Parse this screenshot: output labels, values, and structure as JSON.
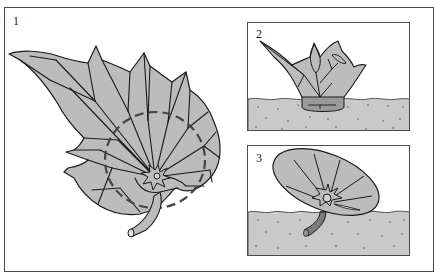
{
  "figure": {
    "panels": [
      {
        "id": 1,
        "label": "1",
        "description": "Whole leaf with veins cut across; dashed circle marks area to cut around leaf stalk junction"
      },
      {
        "id": 2,
        "label": "2",
        "description": "Leaf section inserted upright into compost, cut edge buried"
      },
      {
        "id": 3,
        "label": "3",
        "description": "Circular leaf disc with stalk pushed into compost, lying at an angle on the surface"
      }
    ],
    "colors": {
      "leaf_fill": "#bcbcbc",
      "soil_fill": "#c9c9c9",
      "stem_fill": "#8a8a8a",
      "line": "#1a1a1a",
      "frame": "#4a4a4a"
    }
  }
}
